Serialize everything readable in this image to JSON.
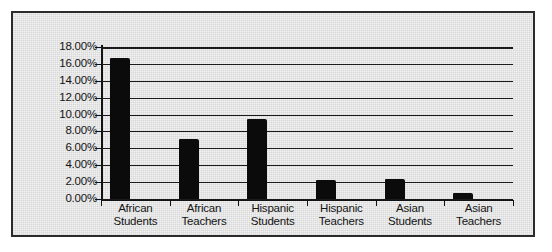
{
  "chart_data": {
    "type": "bar",
    "title": "",
    "subtitle": "",
    "xlabel": "",
    "ylabel": "",
    "categories": [
      "African Students",
      "African Teachers",
      "Hispanic Students",
      "Hispanic Teachers",
      "Asian Students",
      "Asian Teachers"
    ],
    "category_lines": [
      [
        "African",
        "Students"
      ],
      [
        "African",
        "Teachers"
      ],
      [
        "Hispanic",
        "Students"
      ],
      [
        "Hispanic",
        "Teachers"
      ],
      [
        "Asian",
        "Students"
      ],
      [
        "Asian",
        "Teachers"
      ]
    ],
    "values": [
      16.7,
      7.1,
      9.5,
      2.2,
      2.4,
      0.7
    ],
    "value_labels": [
      "16.70%",
      "7.10%",
      "9.50%",
      "2.20%",
      "2.40%",
      "0.70%"
    ],
    "ylim": [
      0,
      18
    ],
    "ytick_step": 2,
    "ytick_labels": [
      "18.00%",
      "16.00%",
      "14.00%",
      "12.00%",
      "10.00%",
      "8.00%",
      "6.00%",
      "4.00%",
      "2.00%",
      "0.00%"
    ],
    "ytick_values": [
      18,
      16,
      14,
      12,
      10,
      8,
      6,
      4,
      2,
      0
    ],
    "grid": true,
    "grid_orientation": "horizontal",
    "legend": false,
    "legend_position": "none",
    "series_color": "#0b0b0b",
    "plot_background": "#f2f2f2",
    "axis_color": "#121212",
    "grid_color": "#1a1a1a",
    "frame_color": "#2b2b2b"
  }
}
